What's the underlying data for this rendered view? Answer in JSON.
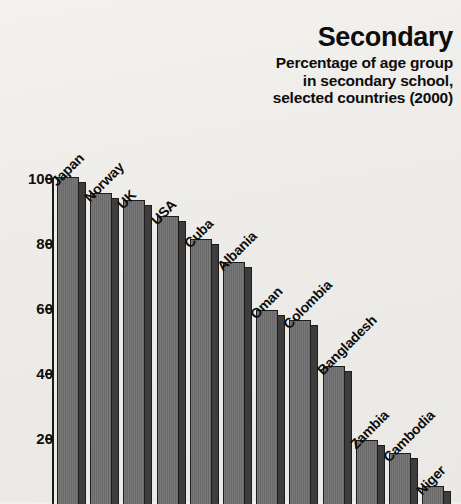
{
  "title": {
    "main": "Secondary",
    "subtitle_lines": [
      "Percentage of age group",
      "in secondary school,",
      "selected countries (2000)"
    ]
  },
  "axis": {
    "tick_labels": [
      "100",
      "80",
      "60",
      "40",
      "20"
    ]
  },
  "colors": {
    "background": "#f2f0ec",
    "bar_face": "#6f6f6f",
    "bar_shadow": "#3d3d3d",
    "outline": "#1d1d1d",
    "text": "#0d0d0d"
  },
  "chart_data": {
    "type": "bar",
    "title": "Secondary",
    "subtitle": "Percentage of age group in secondary school, selected countries (2000)",
    "xlabel": "",
    "ylabel": "",
    "ylim": [
      0,
      100
    ],
    "yticks": [
      20,
      40,
      60,
      80,
      100
    ],
    "grid": false,
    "legend": "none",
    "categories": [
      "Japan",
      "Norway",
      "UK",
      "USA",
      "Cuba",
      "Albania",
      "Oman",
      "Colombia",
      "Bangladesh",
      "Zambia",
      "Cambodia",
      "Niger"
    ],
    "values": [
      100,
      95,
      93,
      88,
      81,
      74,
      59,
      56,
      42,
      19,
      15,
      5
    ]
  }
}
